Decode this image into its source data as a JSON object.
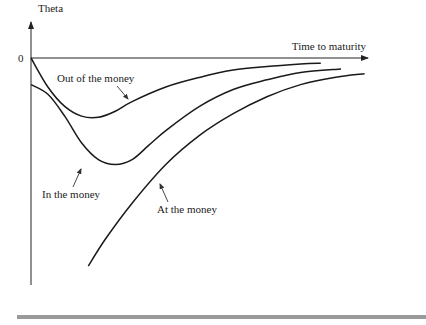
{
  "chart_data": {
    "type": "line",
    "title": "",
    "ylabel": "Theta",
    "xlabel": "Time to maturity",
    "y_zero_label": "0",
    "xlim": [
      0,
      1
    ],
    "ylim": [
      -1,
      0
    ],
    "grid": false,
    "legend": "none (inline annotations)",
    "series": [
      {
        "name": "Out of the money",
        "x": [
          0,
          0.05,
          0.1,
          0.15,
          0.2,
          0.25,
          0.3,
          0.4,
          0.5,
          0.6,
          0.7,
          0.8,
          0.86
        ],
        "y": [
          0,
          -0.12,
          -0.2,
          -0.24,
          -0.245,
          -0.22,
          -0.18,
          -0.12,
          -0.08,
          -0.05,
          -0.035,
          -0.025,
          -0.022
        ]
      },
      {
        "name": "In the money",
        "x": [
          0,
          0.05,
          0.1,
          0.15,
          0.2,
          0.25,
          0.3,
          0.35,
          0.4,
          0.5,
          0.6,
          0.7,
          0.8,
          0.92
        ],
        "y": [
          -0.11,
          -0.15,
          -0.24,
          -0.35,
          -0.42,
          -0.44,
          -0.42,
          -0.36,
          -0.3,
          -0.2,
          -0.13,
          -0.09,
          -0.06,
          -0.045
        ]
      },
      {
        "name": "At the money",
        "x": [
          0.17,
          0.22,
          0.3,
          0.4,
          0.5,
          0.6,
          0.7,
          0.8,
          0.9,
          0.99
        ],
        "y": [
          -0.86,
          -0.75,
          -0.6,
          -0.44,
          -0.32,
          -0.23,
          -0.16,
          -0.11,
          -0.08,
          -0.065
        ]
      }
    ],
    "annotations": [
      {
        "text": "Out of the money",
        "target_series": "Out of the money"
      },
      {
        "text": "In the money",
        "target_series": "In the money"
      },
      {
        "text": "At the money",
        "target_series": "At the money"
      }
    ]
  }
}
